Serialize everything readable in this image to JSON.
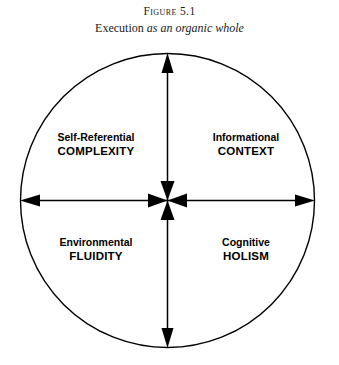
{
  "caption": {
    "figure_label": "Figure",
    "figure_number": "5.1",
    "subtitle_roman": "Execution ",
    "subtitle_italic": "as an organic whole"
  },
  "diagram": {
    "shape": "circle",
    "stroke_color": "#000000",
    "background_color": "#ffffff",
    "axes": [
      {
        "name": "vertical-axis",
        "orientation": "vertical",
        "arrowheads": "double-ended-outward-and-inward"
      },
      {
        "name": "horizontal-axis",
        "orientation": "horizontal",
        "arrowheads": "double-ended-outward-and-inward"
      }
    ],
    "quadrants": [
      {
        "position": "top-left",
        "line1": "Self-Referential",
        "line2": "COMPLEXITY"
      },
      {
        "position": "top-right",
        "line1": "Informational",
        "line2": "CONTEXT"
      },
      {
        "position": "bottom-left",
        "line1": "Environmental",
        "line2": "FLUIDITY"
      },
      {
        "position": "bottom-right",
        "line1": "Cognitive",
        "line2": "HOLISM"
      }
    ]
  }
}
